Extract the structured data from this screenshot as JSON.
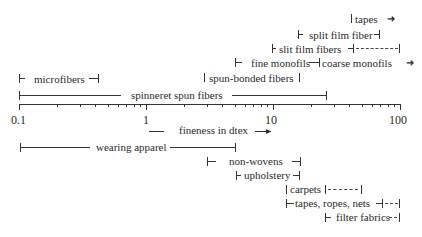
{
  "axis": {
    "label": "fineness in dtex",
    "ticks": [
      "0.1",
      "1",
      "10",
      "100"
    ],
    "scale": "log"
  },
  "upper_ranges": [
    {
      "label": "tapes",
      "from": ">50",
      "to": ">100"
    },
    {
      "label": "split film fiber",
      "from": 20,
      "to": 70
    },
    {
      "label": "slit film fibers",
      "from": 13,
      "to": 100
    },
    {
      "label": "fine monofils",
      "from": 6,
      "to": 27
    },
    {
      "label": "coarse monofils",
      "from": 27,
      "to": ">100"
    },
    {
      "label": "spun-bonded fibers",
      "from": 1.5,
      "to": 15
    },
    {
      "label": "microfibers",
      "from": 0.1,
      "to": 0.6
    },
    {
      "label": "spinneret spun fibers",
      "from": 0.1,
      "to": 25
    }
  ],
  "lower_ranges": [
    {
      "label": "wearing apparel",
      "from": 0.1,
      "to": 5.5
    },
    {
      "label": "non-wovens",
      "from": 5.5,
      "to": 20
    },
    {
      "label": "upholstery",
      "from": 9,
      "to": 22
    },
    {
      "label": "carpets",
      "from": 18,
      "to": 75
    },
    {
      "label": "tapes, ropes, nets",
      "from": 18,
      "to": 90
    },
    {
      "label": "filter fabrics",
      "from": 35,
      "to": 90
    }
  ],
  "labels": {
    "tapes": "tapes",
    "split": "split film fiber",
    "slit": "slit film fibers",
    "fine": "fine monofils",
    "coarse": "coarse monofils",
    "spunbonded": "spun-bonded fibers",
    "micro": "microfibers",
    "spinneret": "spinneret spun fibers",
    "apparel": "wearing apparel",
    "nonwovens": "non-wovens",
    "upholstery": "upholstery",
    "carpets": "carpets",
    "tapesropes": "tapes, ropes, nets",
    "filter": "filter fabrics"
  }
}
